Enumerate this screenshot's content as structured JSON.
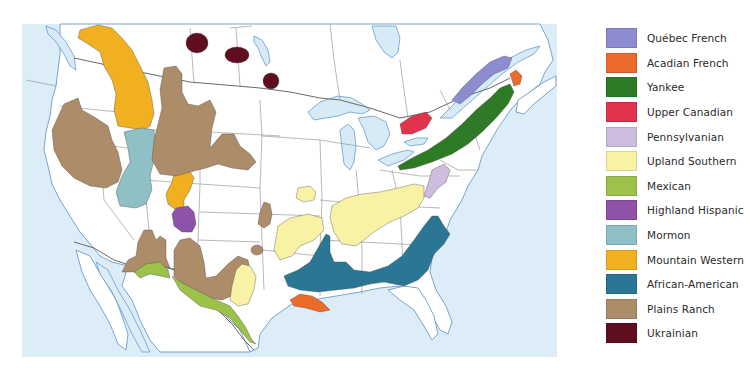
{
  "map": {
    "title": "North American Cultural Regions",
    "colors": {
      "ocean": "#dcedf8",
      "land": "#ffffff",
      "coastline": "#5a8fc4",
      "state_lines": "#8a8a8a"
    }
  },
  "legend": {
    "items": [
      {
        "id": "quebec-french",
        "label": "Québec French",
        "color": "#8e8cd0"
      },
      {
        "id": "acadian-french",
        "label": "Acadian French",
        "color": "#ec6b2a"
      },
      {
        "id": "yankee",
        "label": "Yankee",
        "color": "#2f7a26"
      },
      {
        "id": "upper-canadian",
        "label": "Upper Canadian",
        "color": "#e2334c"
      },
      {
        "id": "pennsylvanian",
        "label": "Pennsylvanian",
        "color": "#cfbde0"
      },
      {
        "id": "upland-southern",
        "label": "Upland Southern",
        "color": "#f8f2a4"
      },
      {
        "id": "mexican",
        "label": "Mexican",
        "color": "#9dc24a"
      },
      {
        "id": "highland-hispanic",
        "label": "Highland Hispanic",
        "color": "#8e52a8"
      },
      {
        "id": "mormon",
        "label": "Mormon",
        "color": "#8ec0c6"
      },
      {
        "id": "mountain-western",
        "label": "Mountain Western",
        "color": "#f0b020"
      },
      {
        "id": "african-american",
        "label": "African-American",
        "color": "#2b7694"
      },
      {
        "id": "plains-ranch",
        "label": "Plains Ranch",
        "color": "#ad8c69"
      },
      {
        "id": "ukrainian",
        "label": "Ukrainian",
        "color": "#5e0e1e"
      }
    ]
  }
}
